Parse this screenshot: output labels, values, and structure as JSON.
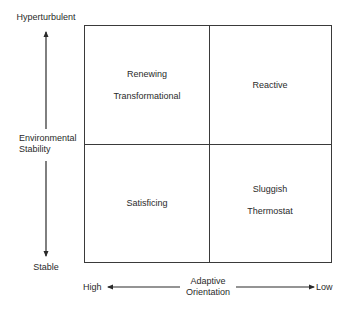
{
  "diagram": {
    "type": "2x2-matrix",
    "y_axis": {
      "title_line1": "Environmental",
      "title_line2": "Stability",
      "top_label": "Hyperturbulent",
      "bottom_label": "Stable"
    },
    "x_axis": {
      "title_line1": "Adaptive",
      "title_line2": "Orientation",
      "left_label": "High",
      "right_label": "Low"
    },
    "quadrants": {
      "top_left": {
        "line1": "Renewing",
        "line2": "Transformational"
      },
      "top_right": {
        "line1": "Reactive",
        "line2": ""
      },
      "bottom_left": {
        "line1": "Satisficing",
        "line2": ""
      },
      "bottom_right": {
        "line1": "Sluggish",
        "line2": "Thermostat"
      }
    },
    "colors": {
      "line": "#3a3a3a",
      "text": "#2a2a2a",
      "background": "#ffffff"
    }
  }
}
